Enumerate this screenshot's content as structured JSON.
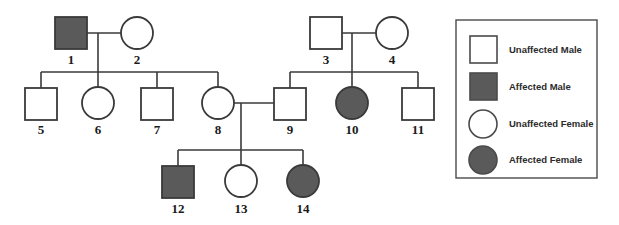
{
  "figure": {
    "type": "pedigree-chart",
    "title": "",
    "background_color": "#ffffff",
    "line_color": "#3a3a3a",
    "shape_stroke_color": "#3a3a3a",
    "unaffected_fill": "#ffffff",
    "affected_fill": "#5a5a5a",
    "label_color": "#1a1a1a"
  },
  "individuals": [
    {
      "id": "1",
      "label": "1",
      "sex": "male",
      "status": "affected",
      "shape": "square",
      "fill": "#5a5a5a",
      "cx": 71,
      "cy": 33
    },
    {
      "id": "2",
      "label": "2",
      "sex": "female",
      "status": "unaffected",
      "shape": "circle",
      "fill": "#ffffff",
      "cx": 137,
      "cy": 33
    },
    {
      "id": "3",
      "label": "3",
      "sex": "male",
      "status": "unaffected",
      "shape": "square",
      "fill": "#ffffff",
      "cx": 326,
      "cy": 33
    },
    {
      "id": "4",
      "label": "4",
      "sex": "female",
      "status": "unaffected",
      "shape": "circle",
      "fill": "#ffffff",
      "cx": 392,
      "cy": 33
    },
    {
      "id": "5",
      "label": "5",
      "sex": "male",
      "status": "unaffected",
      "shape": "square",
      "fill": "#ffffff",
      "cx": 41,
      "cy": 103
    },
    {
      "id": "6",
      "label": "6",
      "sex": "female",
      "status": "unaffected",
      "shape": "circle",
      "fill": "#ffffff",
      "cx": 98,
      "cy": 103
    },
    {
      "id": "7",
      "label": "7",
      "sex": "male",
      "status": "unaffected",
      "shape": "square",
      "fill": "#ffffff",
      "cx": 157,
      "cy": 103
    },
    {
      "id": "8",
      "label": "8",
      "sex": "female",
      "status": "unaffected",
      "shape": "circle",
      "fill": "#ffffff",
      "cx": 218,
      "cy": 103
    },
    {
      "id": "9",
      "label": "9",
      "sex": "male",
      "status": "unaffected",
      "shape": "square",
      "fill": "#ffffff",
      "cx": 290,
      "cy": 103
    },
    {
      "id": "10",
      "label": "10",
      "sex": "female",
      "status": "affected",
      "shape": "circle",
      "fill": "#5a5a5a",
      "cx": 352,
      "cy": 103
    },
    {
      "id": "11",
      "label": "11",
      "sex": "male",
      "status": "unaffected",
      "shape": "square",
      "fill": "#ffffff",
      "cx": 418,
      "cy": 103
    },
    {
      "id": "12",
      "label": "12",
      "sex": "male",
      "status": "affected",
      "shape": "square",
      "fill": "#5a5a5a",
      "cx": 178,
      "cy": 181
    },
    {
      "id": "13",
      "label": "13",
      "sex": "female",
      "status": "unaffected",
      "shape": "circle",
      "fill": "#ffffff",
      "cx": 241,
      "cy": 181
    },
    {
      "id": "14",
      "label": "14",
      "sex": "female",
      "status": "affected",
      "shape": "circle",
      "fill": "#5a5a5a",
      "cx": 303,
      "cy": 181
    }
  ],
  "matings": [
    {
      "id": "mating-1-2",
      "partners": [
        "1",
        "2"
      ],
      "children": [
        "5",
        "6",
        "7",
        "8"
      ]
    },
    {
      "id": "mating-3-4",
      "partners": [
        "3",
        "4"
      ],
      "children": [
        "9",
        "10",
        "11"
      ]
    },
    {
      "id": "mating-8-9",
      "partners": [
        "8",
        "9"
      ],
      "children": [
        "12",
        "13",
        "14"
      ]
    }
  ],
  "legend": {
    "items": [
      {
        "key": "unaffected-male",
        "label": "Unaffected Male",
        "shape": "square",
        "fill": "#ffffff"
      },
      {
        "key": "affected-male",
        "label": "Affected Male",
        "shape": "square",
        "fill": "#5a5a5a"
      },
      {
        "key": "unaffected-female",
        "label": "Unaffected Female",
        "shape": "circle",
        "fill": "#ffffff"
      },
      {
        "key": "affected-female",
        "label": "Affected Female",
        "shape": "circle",
        "fill": "#5a5a5a"
      }
    ]
  }
}
